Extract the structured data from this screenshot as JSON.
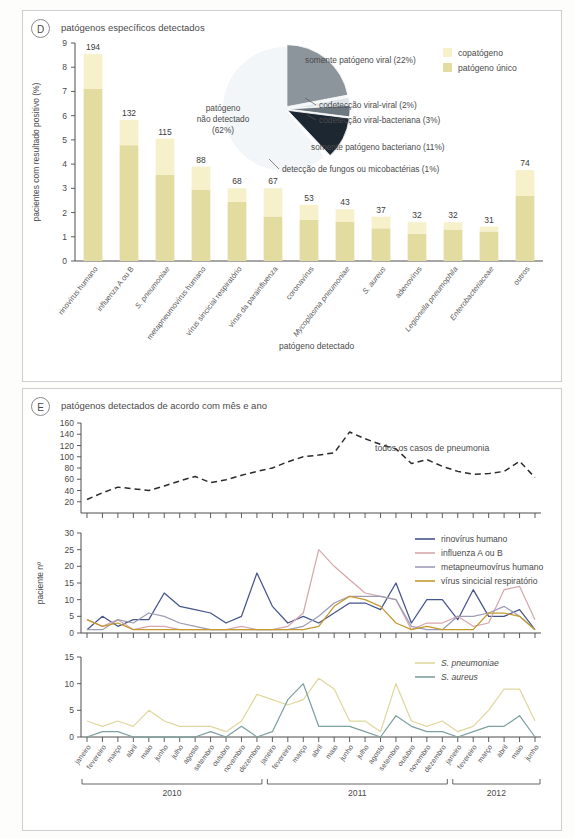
{
  "panels": {
    "d": {
      "tag": "D",
      "title": "patógenos específicos detectados",
      "ylabel": "pacientes com resultado positivo (%)",
      "xlabel": "patógeno detectado",
      "legend": [
        {
          "label": "copatógeno",
          "color": "#f6f0cb"
        },
        {
          "label": "patógeno único",
          "color": "#e3dca0"
        }
      ]
    },
    "e": {
      "tag": "E",
      "title": "patógenos detectados de acordo com mês e ano",
      "ylabel": "paciente nº"
    }
  },
  "chart_data": [
    {
      "id": "panel-d-bars",
      "type": "bar",
      "title": "patógenos específicos detectados",
      "xlabel": "patógeno detectado",
      "ylabel": "pacientes com resultado positivo (%)",
      "ylim": [
        0,
        9
      ],
      "yticks": [
        0,
        1,
        2,
        3,
        4,
        5,
        6,
        7,
        8,
        9
      ],
      "grid": false,
      "stacked": true,
      "categories": [
        "rinovírus humano",
        "influenza A ou B",
        "S. pneumoniae",
        "metapneumovírus humano",
        "vírus sincicial respiratório",
        "vírus da parainfluenza",
        "coronavírus",
        "Mycoplasma pneumoniae",
        "S. aureus",
        "adenovírus",
        "Legionella pneumophila",
        "Enterobacteriaceae",
        "outros"
      ],
      "categories_italic": [
        false,
        false,
        true,
        false,
        false,
        false,
        false,
        true,
        true,
        false,
        true,
        true,
        false
      ],
      "data_labels": [
        194,
        132,
        115,
        88,
        68,
        67,
        53,
        43,
        37,
        32,
        32,
        31,
        74
      ],
      "series": [
        {
          "name": "patógeno único",
          "color": "#e3dca0",
          "values": [
            7.1,
            4.78,
            3.55,
            2.95,
            2.44,
            1.84,
            1.7,
            1.62,
            1.35,
            1.12,
            1.3,
            1.22,
            2.7
          ]
        },
        {
          "name": "copatógeno",
          "color": "#f6f0cb",
          "values": [
            1.45,
            1.05,
            1.5,
            0.95,
            0.56,
            1.16,
            0.62,
            0.52,
            0.48,
            0.48,
            0.3,
            0.2,
            1.05
          ]
        }
      ],
      "totals": [
        8.55,
        5.83,
        5.05,
        3.9,
        3.0,
        3.0,
        2.32,
        2.14,
        1.83,
        1.6,
        1.6,
        1.42,
        3.75
      ]
    },
    {
      "id": "panel-d-pie",
      "type": "pie",
      "slices": [
        {
          "label": "patógeno\nnão detectado\n(62%)",
          "value": 62,
          "color": "#f0f4f7",
          "label_inside": true
        },
        {
          "label": "somente patógeno viral (22%)",
          "value": 22,
          "color": "#8c949c"
        },
        {
          "label": "codetecção viral-viral (2%)",
          "value": 2,
          "color": "#e7ecef"
        },
        {
          "label": "codetecção viral-bacteriana (3%)",
          "value": 3,
          "color": "#6d7880"
        },
        {
          "label": "somente patógeno bacteriano (11%)",
          "value": 11,
          "color": "#1f2a36"
        },
        {
          "label": "detecção de fungos ou micobactérias (1%)",
          "value": 1,
          "color": "#ffffff"
        }
      ]
    },
    {
      "id": "panel-e-top",
      "type": "line",
      "ylabel": "",
      "ylim": [
        0,
        160
      ],
      "yticks": [
        20,
        40,
        60,
        80,
        100,
        120,
        140,
        160
      ],
      "annotation": "todos os casos de pneumonia",
      "x": [
        "janeiro",
        "fevereiro",
        "março",
        "abril",
        "maio",
        "junho",
        "julho",
        "agosto",
        "setembro",
        "outubro",
        "novembro",
        "dezembro",
        "janeiro",
        "fevereiro",
        "março",
        "abril",
        "maio",
        "junho",
        "julho",
        "agosto",
        "setembro",
        "outubro",
        "novembro",
        "dezembro",
        "janeiro",
        "fevereiro",
        "março",
        "abril",
        "maio",
        "junho"
      ],
      "series": [
        {
          "name": "todos os casos de pneumonia",
          "color": "#2b2b2b",
          "dashed": true,
          "values": [
            24,
            36,
            46,
            43,
            40,
            48,
            57,
            65,
            54,
            59,
            67,
            74,
            80,
            91,
            100,
            103,
            107,
            144,
            132,
            122,
            114,
            88,
            95,
            83,
            74,
            69,
            70,
            74,
            92,
            63
          ]
        }
      ]
    },
    {
      "id": "panel-e-mid",
      "type": "line",
      "ylabel": "paciente nº",
      "ylim": [
        0,
        30
      ],
      "yticks": [
        0,
        5,
        10,
        15,
        20,
        25,
        30
      ],
      "x": [
        "janeiro",
        "fevereiro",
        "março",
        "abril",
        "maio",
        "junho",
        "julho",
        "agosto",
        "setembro",
        "outubro",
        "novembro",
        "dezembro",
        "janeiro",
        "fevereiro",
        "março",
        "abril",
        "maio",
        "junho",
        "julho",
        "agosto",
        "setembro",
        "outubro",
        "novembro",
        "dezembro",
        "janeiro",
        "fevereiro",
        "março",
        "abril",
        "maio",
        "junho"
      ],
      "series": [
        {
          "name": "rinovírus humano",
          "color": "#46558c",
          "values": [
            1,
            5,
            2,
            4,
            4,
            12,
            8,
            7,
            6,
            3,
            5,
            18,
            8,
            3,
            5,
            3,
            6,
            9,
            9,
            7,
            15,
            3,
            10,
            10,
            4,
            13,
            5,
            5,
            7,
            1
          ]
        },
        {
          "name": "influenza A ou B",
          "color": "#d6a8ac",
          "values": [
            4,
            2,
            4,
            1,
            2,
            2,
            1,
            1,
            1,
            1,
            2,
            1,
            1,
            2,
            6,
            25,
            20,
            16,
            12,
            11,
            10,
            1,
            3,
            3,
            5,
            2,
            3,
            13,
            14,
            4
          ]
        },
        {
          "name": "metapneumovírus humano",
          "color": "#9e9cb4",
          "values": [
            1,
            1,
            4,
            3,
            6,
            5,
            3,
            2,
            1,
            1,
            1,
            1,
            1,
            1,
            2,
            5,
            9,
            11,
            11,
            11,
            10,
            2,
            1,
            1,
            5,
            5,
            6,
            8,
            5,
            1
          ]
        },
        {
          "name": "vírus sincicial respiratório",
          "color": "#c49a2e",
          "values": [
            4,
            2,
            3,
            1,
            1,
            1,
            1,
            1,
            1,
            1,
            1,
            1,
            1,
            1,
            1,
            2,
            8,
            11,
            10,
            8,
            3,
            1,
            2,
            1,
            1,
            1,
            6,
            6,
            5,
            1
          ]
        }
      ]
    },
    {
      "id": "panel-e-bottom",
      "type": "line",
      "ylim": [
        0,
        15
      ],
      "yticks": [
        0,
        5,
        10,
        15
      ],
      "x": [
        "janeiro",
        "fevereiro",
        "março",
        "abril",
        "maio",
        "junho",
        "julho",
        "agosto",
        "setembro",
        "outubro",
        "novembro",
        "dezembro",
        "janeiro",
        "fevereiro",
        "março",
        "abril",
        "maio",
        "junho",
        "julho",
        "agosto",
        "setembro",
        "outubro",
        "novembro",
        "dezembro",
        "janeiro",
        "fevereiro",
        "março",
        "abril",
        "maio",
        "junho"
      ],
      "series": [
        {
          "name": "S. pneumoniae",
          "color": "#e0d79e",
          "italic": true,
          "values": [
            3,
            2,
            3,
            2,
            5,
            3,
            2,
            2,
            2,
            1,
            3,
            8,
            7,
            6,
            7,
            11,
            9,
            3,
            3,
            1,
            10,
            3,
            2,
            3,
            1,
            2,
            5,
            9,
            9,
            3
          ]
        },
        {
          "name": "S. aureus",
          "color": "#7fa0a0",
          "italic": true,
          "values": [
            0,
            1,
            1,
            0,
            0,
            0,
            0,
            0,
            1,
            0,
            2,
            0,
            1,
            7,
            10,
            2,
            2,
            2,
            1,
            0,
            4,
            2,
            1,
            1,
            0,
            1,
            2,
            2,
            4,
            0
          ]
        }
      ]
    }
  ],
  "timeline": {
    "months": [
      "janeiro",
      "fevereiro",
      "março",
      "abril",
      "maio",
      "junho",
      "julho",
      "agosto",
      "setembro",
      "outubro",
      "novembro",
      "dezembro",
      "janeiro",
      "fevereiro",
      "março",
      "abril",
      "maio",
      "junho",
      "julho",
      "agosto",
      "setembro",
      "outubro",
      "novembro",
      "dezembro",
      "janeiro",
      "fevereiro",
      "março",
      "abril",
      "maio",
      "junho"
    ],
    "years": [
      {
        "label": "2010",
        "start": 0,
        "end": 11
      },
      {
        "label": "2011",
        "start": 12,
        "end": 23
      },
      {
        "label": "2012",
        "start": 24,
        "end": 29
      }
    ]
  }
}
